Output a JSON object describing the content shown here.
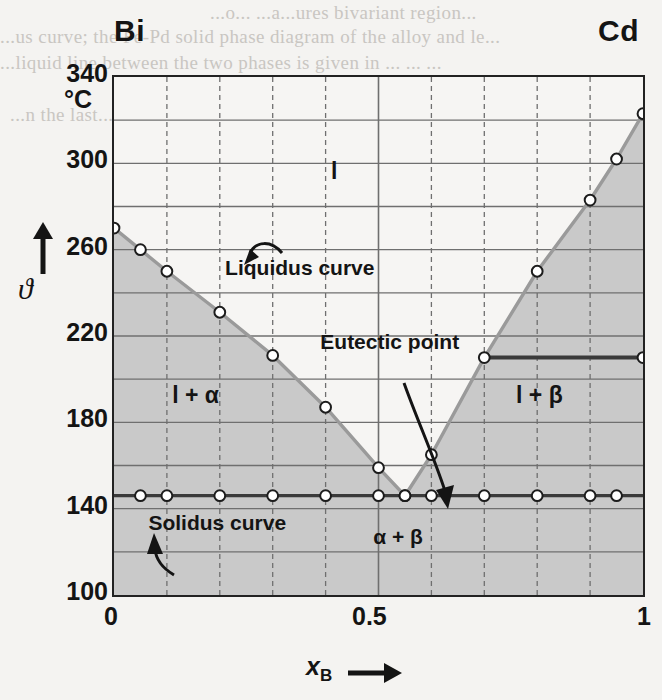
{
  "figure": {
    "left_component": "Bi",
    "right_component": "Cd",
    "unit": "°C",
    "y_axis_symbol": "ϑ",
    "x_axis_symbol": "x",
    "x_axis_subscript": "B"
  },
  "bleed_text": {
    "line1": "...o... ...a...ures bivariant region...",
    "line2": "...us curve;  the  Fe-Pd  solid  phase  diagram  of  the  alloy  and  le...",
    "line3": "...liquid  line  between  the  two  phases  is  given  in  ... ... ...",
    "line4": "",
    "line5": "...n the last...",
    "line6": "",
    "line7": ""
  },
  "y_axis": {
    "ticks": [
      340,
      300,
      260,
      220,
      180,
      140,
      100
    ],
    "min": 100,
    "max": 340,
    "gridline_step": 20
  },
  "x_axis": {
    "ticks": [
      "0",
      "0.5",
      "1"
    ],
    "min": 0,
    "max": 1,
    "gridline_step": 0.1
  },
  "regions": {
    "liquid": "l",
    "liquid_alpha": "l + α",
    "liquid_beta": "l + β",
    "alpha_beta": "α + β"
  },
  "annotations": {
    "liquidus": "Liquidus curve",
    "eutectic": "Eutectic point",
    "solidus": "Solidus curve"
  },
  "colors": {
    "shaded_region": "#c9c9c9",
    "clear_region": "#f6f5f3",
    "curve": "#9a9a9a",
    "solidus_line": "#3a3a3a",
    "frame": "#222222",
    "gridline": "#6f6f6f",
    "marker_fill": "#ffffff",
    "text": "#141414"
  },
  "chart_data": {
    "type": "line",
    "xlabel": "x_B",
    "ylabel": "ϑ / °C",
    "xlim": [
      0,
      1
    ],
    "ylim": [
      100,
      340
    ],
    "grid": true,
    "legend": "none",
    "series": [
      {
        "name": "Liquidus curve",
        "x": [
          0.0,
          0.05,
          0.1,
          0.2,
          0.3,
          0.4,
          0.5,
          0.55,
          0.6,
          0.7,
          0.8,
          0.9,
          0.95,
          1.0
        ],
        "y": [
          270,
          260,
          250,
          231,
          211,
          187,
          159,
          146,
          165,
          210,
          250,
          283,
          302,
          323
        ]
      },
      {
        "name": "Solidus curve",
        "x": [
          0.05,
          0.1,
          0.2,
          0.3,
          0.4,
          0.5,
          0.55,
          0.6,
          0.7,
          0.8,
          0.9,
          0.95
        ],
        "y": [
          146,
          146,
          146,
          146,
          146,
          146,
          146,
          146,
          146,
          146,
          146,
          146
        ]
      },
      {
        "name": "Eutectic tie line",
        "x": [
          0.7,
          1.0
        ],
        "y": [
          210,
          210
        ]
      }
    ],
    "eutectic_point": {
      "x": 0.55,
      "y": 146
    },
    "melting_point_Bi": 270,
    "melting_point_Cd": 323
  }
}
